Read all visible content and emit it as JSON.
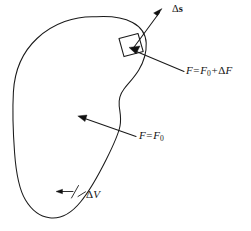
{
  "figure": {
    "name": "control-volume-surface-element-force-diagram",
    "domain": "diagram",
    "background_color": "#ffffff",
    "ink_color": "#1a1a1a",
    "width": 251,
    "height": 231
  },
  "labels": {
    "displacement": {
      "name": "delta-s",
      "delta": "Δ",
      "symbol": "s",
      "full_text": "Δs",
      "bold_symbol": true,
      "meaning": "displacement vector of surface element"
    },
    "force_perturbed": {
      "name": "f-equals-f0-plus-delta-f",
      "lhs": "F",
      "equals": "=",
      "base": "F",
      "base_subscript": "0",
      "plus": "+",
      "delta": "Δ",
      "delta_symbol": "F",
      "full_text": "F = F0 + ΔF",
      "meaning": "force on the displaced surface element"
    },
    "force_base": {
      "name": "f-equals-f0",
      "lhs": "F",
      "equals": "=",
      "base": "F",
      "base_subscript": "0",
      "full_text": "F = F0",
      "meaning": "unperturbed force on the boundary"
    },
    "volume": {
      "name": "delta-v",
      "delta": "Δ",
      "symbol": "V",
      "full_text": "ΔV",
      "meaning": "enclosed volume element"
    }
  },
  "shapes": {
    "blob": {
      "name": "closed-volume-boundary",
      "description": "irregular closed kidney-shaped outline enclosing the volume"
    },
    "surface_element": {
      "name": "surface-element-square",
      "description": "small rotated quadrilateral patch on the boundary"
    },
    "arrows": [
      {
        "name": "delta-s-arrow",
        "direction": "up-right",
        "from": "surface-element",
        "to": "delta-s-label"
      },
      {
        "name": "force-perturbed-arrow",
        "direction": "down-right",
        "from": "surface-element",
        "to": "f-perturbed-label"
      },
      {
        "name": "force-base-arrow",
        "direction": "up-left",
        "from": "f-zero-label",
        "to": "interior"
      },
      {
        "name": "delta-v-pointer-arrow",
        "direction": "left",
        "from": "delta-v-label",
        "to": "interior"
      }
    ]
  }
}
